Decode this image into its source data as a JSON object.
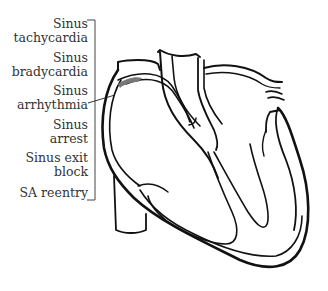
{
  "diagram": {
    "labels": [
      {
        "line1": "Sinus",
        "line2": "tachycardia"
      },
      {
        "line1": "Sinus",
        "line2": "bradycardia"
      },
      {
        "line1": "Sinus",
        "line2": "arrhythmia"
      },
      {
        "line1": "Sinus",
        "line2": "arrest"
      },
      {
        "line1": "Sinus exit",
        "line2": "block"
      },
      {
        "line1": "SA reentry",
        "line2": ""
      }
    ],
    "colors": {
      "text": "#333333",
      "outline": "#111111",
      "sa_node": "#777777",
      "background": "#ffffff"
    }
  }
}
